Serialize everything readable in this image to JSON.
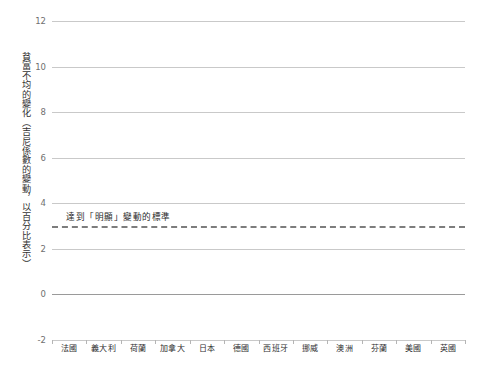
{
  "top_title": "",
  "axis": {
    "y_title": "貧富不均的變化（吉尼係數的變動，以百分比表示）",
    "y_ticks": [
      "12",
      "10",
      "8",
      "6",
      "4",
      "2",
      "0",
      "-2"
    ],
    "y_min": -2,
    "y_max": 12
  },
  "annotation": {
    "threshold_label": "達到「明顯」變動的標準",
    "threshold_value": 3.0
  },
  "colors": {
    "bar": "#8c8c8c",
    "gridline": "#c9c9c9",
    "zero_line": "#9a9a9a",
    "dashed_line": "#7d7d7d",
    "tick_text": "#6f6f6f",
    "label_text": "#2f2f2f"
  },
  "chart_data": {
    "type": "bar",
    "title": "",
    "xlabel": "",
    "ylabel": "貧富不均的變化（吉尼係數的變動，以百分比表示）",
    "ylim": [
      -2,
      12
    ],
    "yticks": [
      -2,
      0,
      2,
      4,
      6,
      8,
      10,
      12
    ],
    "grid": true,
    "legend": "none",
    "categories": [
      "法國",
      "義大利",
      "荷蘭",
      "加拿大",
      "日本",
      "德國",
      "西班牙",
      "挪威",
      "澳洲",
      "芬蘭",
      "美國",
      "英國"
    ],
    "values": [
      -2.0,
      2.2,
      2.65,
      2.65,
      2.8,
      3.25,
      3.7,
      3.7,
      3.95,
      4.95,
      7.35,
      10.0
    ],
    "annotations": [
      {
        "type": "hline",
        "value": 3.0,
        "style": "dashed",
        "label": "達到「明顯」變動的標準"
      }
    ]
  }
}
